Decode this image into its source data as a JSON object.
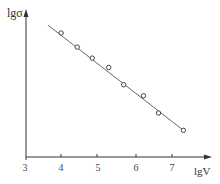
{
  "chart_data": {
    "type": "scatter",
    "title": "",
    "xlabel": "lgV",
    "ylabel": "lgσ",
    "x_ticks": [
      "3",
      "4",
      "5",
      "6",
      "7"
    ],
    "y_ticks": [],
    "xlim": [
      3,
      7.6
    ],
    "grid": false,
    "legend": null,
    "series": [
      {
        "name": "measured",
        "marker": "open-circle",
        "x": [
          3.96,
          4.4,
          4.81,
          5.26,
          5.67,
          6.21,
          6.62,
          7.3
        ],
        "y_relative": [
          0.79,
          0.7,
          0.63,
          0.57,
          0.46,
          0.39,
          0.28,
          0.17
        ]
      },
      {
        "name": "linear fit",
        "marker": "line",
        "x": [
          3.6,
          7.3
        ],
        "y_relative": [
          0.84,
          0.17
        ]
      }
    ],
    "annotations": []
  },
  "axes": {
    "x_label": "lgV",
    "y_label": "lgσ",
    "x_tick_labels": [
      "3",
      "4",
      "5",
      "6",
      "7"
    ]
  },
  "colors": {
    "axis": "#333333",
    "line": "#666666",
    "marker": "#444444"
  }
}
